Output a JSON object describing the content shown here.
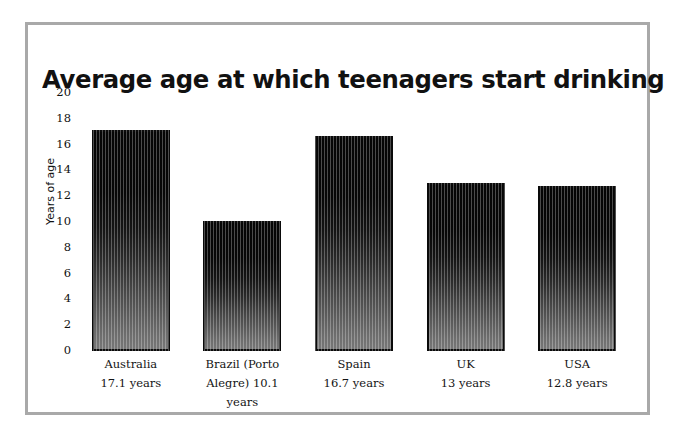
{
  "figure": {
    "title": "Average age at which teenagers start drinking",
    "frame_color": "#a9a9a9"
  },
  "chart_data": {
    "type": "bar",
    "title": "Average age at which teenagers start drinking",
    "xlabel": "",
    "ylabel": "Years of age",
    "ylim": [
      0,
      20
    ],
    "yticks": [
      "20",
      "18",
      "16",
      "14",
      "12",
      "10",
      "8",
      "6",
      "4",
      "2",
      "0"
    ],
    "grid": false,
    "legend": "none",
    "bar_fill": "#0a0a0a",
    "bar_edge_color": "#0a0a0a",
    "categories": [
      "Australia",
      "Brazil (Porto Alegre)",
      "Spain",
      "UK",
      "USA"
    ],
    "values": [
      17.1,
      10.1,
      16.7,
      13,
      12.8
    ],
    "tick_labels": [
      {
        "name": "Australia",
        "value_text": "17.1 years",
        "lines": [
          "Australia",
          "17.1 years"
        ]
      },
      {
        "name": "Brazil (Porto Alegre)",
        "value_text": "10.1 years",
        "lines": [
          "Brazil (Porto",
          "Alegre) 10.1",
          "years"
        ]
      },
      {
        "name": "Spain",
        "value_text": "16.7 years",
        "lines": [
          "Spain",
          "16.7 years"
        ]
      },
      {
        "name": "UK",
        "value_text": "13 years",
        "lines": [
          "UK",
          "13 years"
        ]
      },
      {
        "name": "USA",
        "value_text": "12.8 years",
        "lines": [
          "USA",
          "12.8 years"
        ]
      }
    ]
  }
}
